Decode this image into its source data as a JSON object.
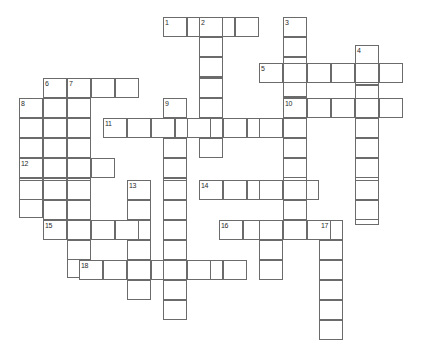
{
  "page": {
    "width": 423,
    "height": 351,
    "background_color": "#ffffff",
    "cell_border_color": "#6b6b6b",
    "cell_fill_color": "#ffffff",
    "number_color": "#2b2b2b"
  },
  "grid": {
    "cell_width": 24,
    "cell_height": 20,
    "type": "crossword",
    "empty": true,
    "note": "All cells are blank; no letters are filled in."
  },
  "entries": [
    {
      "number": "1",
      "direction": "across",
      "x": 163,
      "y": 17,
      "length": 4,
      "label": "1-across"
    },
    {
      "number": "2",
      "direction": "down",
      "x": 199,
      "y": 17,
      "length": 7,
      "label": "2-down"
    },
    {
      "number": "3",
      "direction": "down",
      "x": 283,
      "y": 17,
      "length": 11,
      "label": "3-down"
    },
    {
      "number": "4",
      "direction": "down",
      "x": 355,
      "y": 45,
      "length": 9,
      "label": "4-down"
    },
    {
      "number": "5",
      "direction": "across",
      "x": 259,
      "y": 63,
      "length": 6,
      "label": "5-across"
    },
    {
      "number": "6",
      "direction": "down",
      "x": 43,
      "y": 78,
      "length": 6,
      "label": "6-down"
    },
    {
      "number": "7",
      "direction": "down",
      "x": 67,
      "y": 78,
      "length": 10,
      "label": "7-down"
    },
    {
      "number": "8",
      "direction": "down",
      "x": 19,
      "y": 98,
      "length": 6,
      "label": "8-down"
    },
    {
      "number": "9",
      "direction": "down",
      "x": 163,
      "y": 98,
      "length": 10,
      "label": "9-down"
    },
    {
      "number": "10",
      "direction": "across",
      "x": 283,
      "y": 98,
      "length": 5,
      "label": "10-across"
    },
    {
      "number": "11",
      "direction": "across",
      "x": 103,
      "y": 118,
      "length": 8,
      "label": "11-across"
    },
    {
      "number": "12",
      "direction": "across",
      "x": 19,
      "y": 158,
      "length": 4,
      "label": "12-across"
    },
    {
      "number": "13",
      "direction": "down",
      "x": 127,
      "y": 180,
      "length": 5,
      "label": "13-down"
    },
    {
      "number": "14",
      "direction": "across",
      "x": 199,
      "y": 180,
      "length": 5,
      "label": "14-across"
    },
    {
      "number": "15",
      "direction": "across",
      "x": 43,
      "y": 220,
      "length": 4,
      "label": "15-across"
    },
    {
      "number": "16",
      "direction": "across",
      "x": 219,
      "y": 220,
      "length": 5,
      "label": "16-across"
    },
    {
      "number": "17",
      "direction": "down",
      "x": 319,
      "y": 220,
      "length": 6,
      "label": "17-down"
    },
    {
      "number": "18",
      "direction": "across",
      "x": 79,
      "y": 260,
      "length": 7,
      "label": "18-across"
    }
  ],
  "cells": [
    {
      "x": 163,
      "y": 17
    },
    {
      "x": 187,
      "y": 17
    },
    {
      "x": 199,
      "y": 17
    },
    {
      "x": 211,
      "y": 17
    },
    {
      "x": 235,
      "y": 17
    },
    {
      "x": 283,
      "y": 17
    },
    {
      "x": 199,
      "y": 37
    },
    {
      "x": 283,
      "y": 37
    },
    {
      "x": 355,
      "y": 45
    },
    {
      "x": 199,
      "y": 57
    },
    {
      "x": 259,
      "y": 63
    },
    {
      "x": 283,
      "y": 63
    },
    {
      "x": 307,
      "y": 63
    },
    {
      "x": 331,
      "y": 63
    },
    {
      "x": 355,
      "y": 63
    },
    {
      "x": 379,
      "y": 63
    },
    {
      "x": 43,
      "y": 78
    },
    {
      "x": 67,
      "y": 78
    },
    {
      "x": 91,
      "y": 78
    },
    {
      "x": 115,
      "y": 78
    },
    {
      "x": 199,
      "y": 78
    },
    {
      "x": 19,
      "y": 98
    },
    {
      "x": 43,
      "y": 98
    },
    {
      "x": 67,
      "y": 98
    },
    {
      "x": 163,
      "y": 98
    },
    {
      "x": 199,
      "y": 98
    },
    {
      "x": 283,
      "y": 98
    },
    {
      "x": 307,
      "y": 98
    },
    {
      "x": 331,
      "y": 98
    },
    {
      "x": 355,
      "y": 98
    },
    {
      "x": 379,
      "y": 98
    },
    {
      "x": 19,
      "y": 118
    },
    {
      "x": 43,
      "y": 118
    },
    {
      "x": 67,
      "y": 118
    },
    {
      "x": 103,
      "y": 118
    },
    {
      "x": 127,
      "y": 118
    },
    {
      "x": 151,
      "y": 118
    },
    {
      "x": 163,
      "y": 118
    },
    {
      "x": 187,
      "y": 118
    },
    {
      "x": 199,
      "y": 118
    },
    {
      "x": 223,
      "y": 118
    },
    {
      "x": 247,
      "y": 118
    },
    {
      "x": 259,
      "y": 118
    },
    {
      "x": 283,
      "y": 118
    },
    {
      "x": 355,
      "y": 118
    },
    {
      "x": 19,
      "y": 138
    },
    {
      "x": 43,
      "y": 138
    },
    {
      "x": 67,
      "y": 138
    },
    {
      "x": 163,
      "y": 138
    },
    {
      "x": 199,
      "y": 138
    },
    {
      "x": 283,
      "y": 138
    },
    {
      "x": 355,
      "y": 138
    },
    {
      "x": 19,
      "y": 158
    },
    {
      "x": 43,
      "y": 158
    },
    {
      "x": 67,
      "y": 158
    },
    {
      "x": 91,
      "y": 158
    },
    {
      "x": 163,
      "y": 158
    },
    {
      "x": 283,
      "y": 158
    },
    {
      "x": 355,
      "y": 158
    },
    {
      "x": 19,
      "y": 180
    },
    {
      "x": 43,
      "y": 180
    },
    {
      "x": 67,
      "y": 180
    },
    {
      "x": 127,
      "y": 180
    },
    {
      "x": 163,
      "y": 180
    },
    {
      "x": 199,
      "y": 180
    },
    {
      "x": 223,
      "y": 180
    },
    {
      "x": 247,
      "y": 180
    },
    {
      "x": 259,
      "y": 180
    },
    {
      "x": 283,
      "y": 180
    },
    {
      "x": 355,
      "y": 180
    },
    {
      "x": 43,
      "y": 200
    },
    {
      "x": 67,
      "y": 200
    },
    {
      "x": 127,
      "y": 200
    },
    {
      "x": 163,
      "y": 200
    },
    {
      "x": 283,
      "y": 200
    },
    {
      "x": 355,
      "y": 200
    },
    {
      "x": 43,
      "y": 220
    },
    {
      "x": 67,
      "y": 220
    },
    {
      "x": 91,
      "y": 220
    },
    {
      "x": 115,
      "y": 220
    },
    {
      "x": 127,
      "y": 220
    },
    {
      "x": 163,
      "y": 220
    },
    {
      "x": 219,
      "y": 220
    },
    {
      "x": 243,
      "y": 220
    },
    {
      "x": 259,
      "y": 220
    },
    {
      "x": 283,
      "y": 220
    },
    {
      "x": 307,
      "y": 220
    },
    {
      "x": 319,
      "y": 220
    },
    {
      "x": 67,
      "y": 240
    },
    {
      "x": 127,
      "y": 240
    },
    {
      "x": 163,
      "y": 240
    },
    {
      "x": 259,
      "y": 240
    },
    {
      "x": 319,
      "y": 240
    },
    {
      "x": 79,
      "y": 260
    },
    {
      "x": 103,
      "y": 260
    },
    {
      "x": 127,
      "y": 260
    },
    {
      "x": 151,
      "y": 260
    },
    {
      "x": 163,
      "y": 260
    },
    {
      "x": 187,
      "y": 260
    },
    {
      "x": 199,
      "y": 260
    },
    {
      "x": 223,
      "y": 260
    },
    {
      "x": 259,
      "y": 260
    },
    {
      "x": 319,
      "y": 260
    },
    {
      "x": 127,
      "y": 280
    },
    {
      "x": 163,
      "y": 280
    },
    {
      "x": 319,
      "y": 280
    },
    {
      "x": 163,
      "y": 300
    },
    {
      "x": 319,
      "y": 300
    },
    {
      "x": 319,
      "y": 320
    }
  ]
}
